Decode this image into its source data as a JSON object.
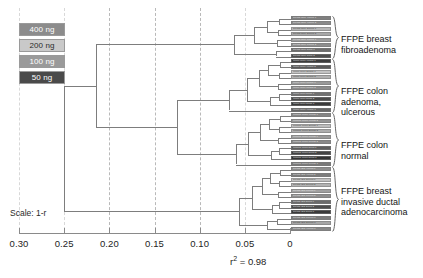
{
  "figure": {
    "type": "dendrogram",
    "scale_label": "Scale: 1-r",
    "r2_annotation": "r² = 0.98"
  },
  "legend": {
    "items": [
      {
        "label": "400 ng",
        "color": "#8c8c8c",
        "text_color": "#ffffff"
      },
      {
        "label": "200 ng",
        "color": "#c9c9c9",
        "text_color": "#2b2b2b"
      },
      {
        "label": "100 ng",
        "color": "#9a9a9a",
        "text_color": "#ffffff"
      },
      {
        "label": "50 ng",
        "color": "#4a4a4a",
        "text_color": "#ffffff"
      }
    ]
  },
  "axis": {
    "label": "",
    "ticks": [
      "0.30",
      "0.25",
      "0.20",
      "0.15",
      "0.10",
      "0.05",
      "0"
    ],
    "tick_values": [
      0.3,
      0.25,
      0.2,
      0.15,
      0.1,
      0.05,
      0
    ],
    "gridline_values": [
      0.2,
      0.15,
      0.1
    ],
    "range": [
      0.3,
      0
    ],
    "reversed": true
  },
  "clusters": [
    {
      "name": "ffpe-breast-fibroadenoma",
      "label": "FFPE breast\nfibroadenoma"
    },
    {
      "name": "ffpe-colon-adenoma-ulcerous",
      "label": "FFPE colon\nadenoma,\nulcerous"
    },
    {
      "name": "ffpe-colon-normal",
      "label": "FFPE colon\nnormal"
    },
    {
      "name": "ffpe-breast-invasive-ductal-adenocarcinoma",
      "label": "FFPE breast\ninvasive ductal\nadenocarcinoma"
    }
  ],
  "chart_data": {
    "type": "dendrogram",
    "title": "",
    "xlabel": "Scale: 1-r",
    "ylabel": "",
    "xlim": [
      0.3,
      0
    ],
    "grid": true,
    "annotations": [
      "r² = 0.98",
      "Scale: 1-r"
    ],
    "legend_entries": [
      "400 ng",
      "200 ng",
      "100 ng",
      "50 ng"
    ],
    "cluster_names": [
      "FFPE breast fibroadenoma",
      "FFPE colon adenoma, ulcerous",
      "FFPE colon normal",
      "FFPE breast invasive ductal adenocarcinoma"
    ],
    "root_merge_distance": 0.25,
    "cluster_merge_distances": [
      0.215,
      0.165,
      0.125,
      0.25
    ],
    "leaf_count": 40,
    "leaves": [
      {
        "text": "breast fibro 400ng 1",
        "shade": "#7f7f7f"
      },
      {
        "text": "breast fibro 400ng 2",
        "shade": "#8a8a8a"
      },
      {
        "text": "breast fibro 200ng 1",
        "shade": "#b5b5b5"
      },
      {
        "text": "breast fibro 200ng 2",
        "shade": "#a8a8a8"
      },
      {
        "text": "breast fibro 100ng 1",
        "shade": "#9d9d9d"
      },
      {
        "text": "breast fibro 100ng 2",
        "shade": "#8f8f8f"
      },
      {
        "text": "breast fibro 50ng 1",
        "shade": "#6d6d6d"
      },
      {
        "text": "breast fibro 50ng 2",
        "shade": "#4f4f4f"
      },
      {
        "text": "colon ulcer 400ng 1",
        "shade": "#3c3c3c"
      },
      {
        "text": "colon ulcer 400ng 2",
        "shade": "#5a5a5a"
      },
      {
        "text": "colon ulcer 200ng 1",
        "shade": "#c2c2c2"
      },
      {
        "text": "colon ulcer 200ng 2",
        "shade": "#b0b0b0"
      },
      {
        "text": "colon ulcer 100ng 1",
        "shade": "#9a9a9a"
      },
      {
        "text": "colon ulcer 100ng 2",
        "shade": "#8d8d8d"
      },
      {
        "text": "colon ulcer 50ng 1",
        "shade": "#707070"
      },
      {
        "text": "colon ulcer 50ng 2",
        "shade": "#4a4a4a"
      },
      {
        "text": "colon ulcer 50ng 3",
        "shade": "#3a3a3a"
      },
      {
        "text": "colon ulcer 400ng 3",
        "shade": "#666666"
      },
      {
        "text": "normal colon 400ng 1",
        "shade": "#858585"
      },
      {
        "text": "normal colon 400ng 2",
        "shade": "#939393"
      },
      {
        "text": "normal colon 200ng 1",
        "shade": "#bdbdbd"
      },
      {
        "text": "normal colon 200ng 2",
        "shade": "#aeaeae"
      },
      {
        "text": "normal colon 100ng 1",
        "shade": "#9c9c9c"
      },
      {
        "text": "normal colon 100ng 2",
        "shade": "#8a8a8a"
      },
      {
        "text": "normal colon 50ng 1",
        "shade": "#5f5f5f"
      },
      {
        "text": "normal colon 50ng 2",
        "shade": "#434343"
      },
      {
        "text": "normal colon 50ng 3",
        "shade": "#333333"
      },
      {
        "text": "normal colon 100ng 3",
        "shade": "#7a7a7a"
      },
      {
        "text": "breast IDC 400ng 1",
        "shade": "#8e8e8e"
      },
      {
        "text": "breast IDC 400ng 2",
        "shade": "#7c7c7c"
      },
      {
        "text": "breast IDC 200ng 1",
        "shade": "#c0c0c0"
      },
      {
        "text": "breast IDC 200ng 2",
        "shade": "#b2b2b2"
      },
      {
        "text": "breast IDC 100ng 1",
        "shade": "#a0a0a0"
      },
      {
        "text": "breast IDC 100ng 2",
        "shade": "#909090"
      },
      {
        "text": "breast IDC 50ng 1",
        "shade": "#6a6a6a"
      },
      {
        "text": "breast IDC 50ng 2",
        "shade": "#4d4d4d"
      },
      {
        "text": "breast IDC 50ng 3",
        "shade": "#3b3b3b"
      },
      {
        "text": "breast IDC 100ng 3",
        "shade": "#7e7e7e"
      },
      {
        "text": "breast IDC 200ng 3",
        "shade": "#a6a6a6"
      },
      {
        "text": "breast IDC 400ng 3",
        "shade": "#888888"
      }
    ]
  }
}
